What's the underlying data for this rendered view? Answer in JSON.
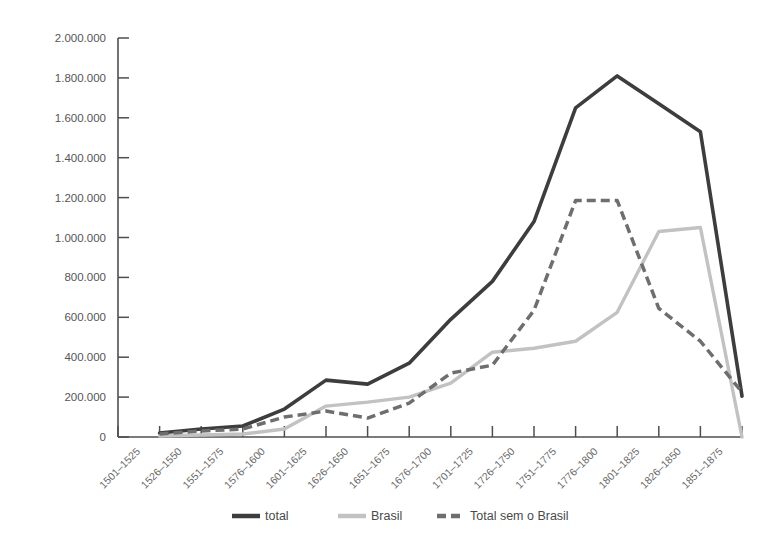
{
  "chart_data": {
    "type": "line",
    "title": "",
    "xlabel": "",
    "ylabel": "",
    "ylim": [
      0,
      2000000
    ],
    "grid": false,
    "legend_position": "bottom-center",
    "categories": [
      "1501–1525",
      "1526–1550",
      "1551–1575",
      "1576–1600",
      "1601–1625",
      "1626–1650",
      "1651–1675",
      "1676–1700",
      "1701–1725",
      "1726–1750",
      "1751–1775",
      "1776–1800",
      "1801–1825",
      "1826–1850",
      "1851–1875"
    ],
    "y_ticks": [
      0,
      200000,
      400000,
      600000,
      800000,
      1000000,
      1200000,
      1400000,
      1600000,
      1800000,
      2000000
    ],
    "y_tick_labels": [
      "0",
      "200.000",
      "400.000",
      "600.000",
      "800.000",
      "1.000.000",
      "1.200.000",
      "1.400.000",
      "1.600.000",
      "1.800.000",
      "2.000.000"
    ],
    "series": [
      {
        "name": "total",
        "style": "solid",
        "color": "#3d3d3d",
        "values": [
          20000,
          40000,
          55000,
          140000,
          285000,
          265000,
          370000,
          590000,
          780000,
          1080000,
          1650000,
          1810000,
          1670000,
          1530000,
          205000
        ]
      },
      {
        "name": "Brasil",
        "style": "solid",
        "color": "#c2c2c2",
        "values": [
          5000,
          10000,
          15000,
          40000,
          155000,
          175000,
          200000,
          270000,
          425000,
          445000,
          480000,
          625000,
          1030000,
          1050000,
          0
        ]
      },
      {
        "name": "Total sem o Brasil",
        "style": "dashed",
        "color": "#6e6e6e",
        "values": [
          15000,
          30000,
          40000,
          100000,
          130000,
          95000,
          170000,
          320000,
          360000,
          635000,
          1185000,
          1185000,
          645000,
          480000,
          225000
        ]
      }
    ]
  },
  "legend": {
    "items": [
      {
        "label": "total",
        "color": "#3d3d3d",
        "style": "solid"
      },
      {
        "label": "Brasil",
        "color": "#c2c2c2",
        "style": "solid"
      },
      {
        "label": "Total sem o Brasil",
        "color": "#6e6e6e",
        "style": "dashed"
      }
    ]
  }
}
